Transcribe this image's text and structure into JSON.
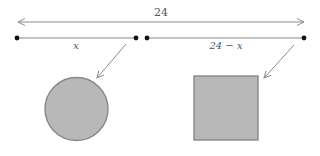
{
  "diagram": {
    "total_length_label": "24",
    "left_segment_label": "x",
    "right_segment_label": "24 − x",
    "left_shape": "circle",
    "right_shape": "square",
    "colors": {
      "line": "#8a8a8a",
      "dot": "#111111",
      "shape_fill": "#b8b8b8",
      "shape_stroke": "#888888",
      "label": "#555555"
    }
  }
}
